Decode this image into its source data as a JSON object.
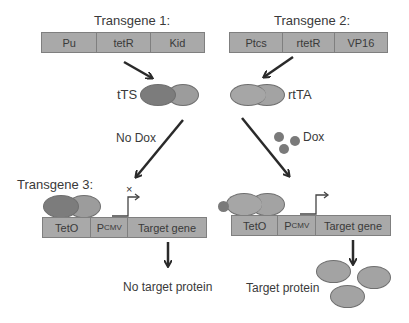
{
  "transgene1": {
    "title": "Transgene 1:",
    "segments": [
      "Pu",
      "tetR",
      "Kid"
    ],
    "product_label": "tTS"
  },
  "transgene2": {
    "title": "Transgene 2:",
    "segments": [
      "Ptcs",
      "rtetR",
      "VP16"
    ],
    "product_label": "rtTA"
  },
  "transgene3": {
    "title": "Transgene 3:",
    "segments_left": [
      "TetO",
      "P",
      "CMV",
      "Target gene"
    ],
    "segments_right": [
      "TetO",
      "P",
      "CMV",
      "Target gene"
    ],
    "blocked_marker": "×"
  },
  "conditions": {
    "no_dox": "No Dox",
    "dox": "Dox"
  },
  "outcomes": {
    "left": "No target protein",
    "right": "Target protein"
  },
  "colors": {
    "bar_fill": "#a9a9a9",
    "bar_border": "#7f7f7f",
    "tts_dark": "#7c7c7c",
    "tts_light": "#9c9c9c",
    "rtta": "#a3a3a3",
    "dox": "#7a7a7a",
    "arrow": "#2a2a2a"
  }
}
